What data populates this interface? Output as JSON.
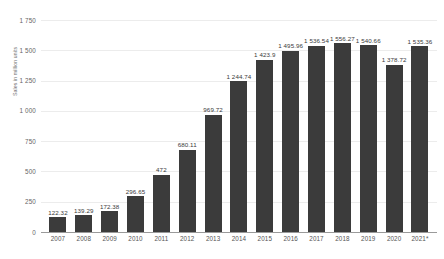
{
  "chart_data": {
    "type": "bar",
    "title": "",
    "subtitle": "",
    "xlabel": "",
    "ylabel": "Sales in million units",
    "ylim": [
      0,
      1750
    ],
    "yticks": [
      "0",
      "250",
      "500",
      "750",
      "1 000",
      "1 250",
      "1 500",
      "1 750"
    ],
    "ytick_values": [
      0,
      250,
      500,
      750,
      1000,
      1250,
      1500,
      1750
    ],
    "grid": true,
    "legend": "none",
    "categories": [
      "2007",
      "2008",
      "2009",
      "2010",
      "2011",
      "2012",
      "2013",
      "2014",
      "2015",
      "2016",
      "2017",
      "2018",
      "2019",
      "2020",
      "2021*"
    ],
    "values": [
      122.32,
      139.29,
      172.38,
      296.65,
      472,
      680.11,
      969.72,
      1244.74,
      1423.9,
      1495.96,
      1536.54,
      1556.27,
      1540.66,
      1378.72,
      1535.36
    ],
    "value_labels": [
      "122.32",
      "139.29",
      "172.38",
      "296.65",
      "472",
      "680.11",
      "969.72",
      "1 244.74",
      "1 423.9",
      "1 495.96",
      "1 536.54",
      "1 556.27",
      "1 540.66",
      "1 378.72",
      "1 535.36"
    ],
    "colors": {
      "bar": "#3b3b3b",
      "grid": "#ececec",
      "axis": "#9a9a9a",
      "label_text": "#3a3a3a",
      "tick_text": "#666666",
      "background": "#ffffff"
    }
  }
}
